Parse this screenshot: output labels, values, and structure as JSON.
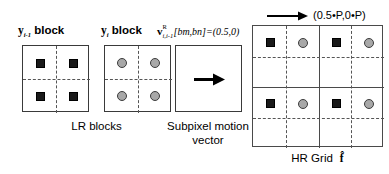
{
  "figure": {
    "title_annotation": "(0.5•P,0•P)",
    "panels": {
      "lr_prev": {
        "label_var": "y",
        "label_sub": "i-1",
        "label_rest": " block",
        "marker": "black-square",
        "marker_count": 4
      },
      "lr_curr": {
        "label_var": "y",
        "label_sub": "i",
        "label_rest": " block",
        "marker": "gray-circle",
        "marker_count": 4
      },
      "motion": {
        "formula_var": "v",
        "formula_sup": "R",
        "formula_sub": "i,i-1",
        "formula_rest": "[bm,bn]=(0.5,0)",
        "arrow": "right-arrow"
      },
      "hr": {
        "grid_rows": 2,
        "grid_cols": 2,
        "markers_per_cell": [
          "black-square",
          "gray-circle"
        ]
      }
    },
    "captions": {
      "lr_blocks": "LR blocks",
      "subpixel_line1": "Subpixel motion",
      "subpixel_line2": "vector",
      "hr_grid": "HR Grid",
      "hr_grid_symbol": "f̂"
    },
    "colors": {
      "square_fill": "#1a1a1a",
      "circle_fill": "#a8a8a8",
      "circle_stroke": "#3c3c3c",
      "box_stroke": "#3a3a3a",
      "dash_stroke": "#555555",
      "background": "#ffffff"
    }
  }
}
